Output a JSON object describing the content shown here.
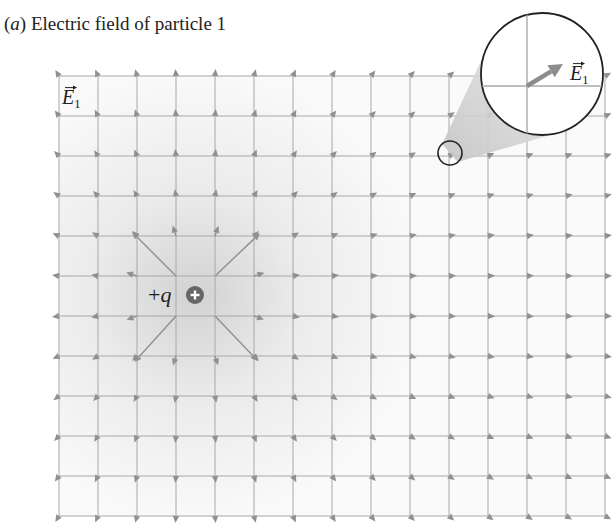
{
  "caption": {
    "label": "a",
    "text": "Electric field of particle 1"
  },
  "field_label": {
    "symbol": "E",
    "subscript": "1",
    "x": 62,
    "y": 104
  },
  "charge": {
    "label_sign": "+",
    "label_var": "q",
    "sign_glyph": "+",
    "x": 195,
    "y": 295,
    "r": 9,
    "color": "#666666"
  },
  "grid": {
    "x0": 59,
    "dx": 39,
    "nx": 15,
    "y0": 76,
    "dy": 40,
    "ny": 12,
    "line_color": "#a8a8a8",
    "arrow_color": "#909090"
  },
  "magnifier": {
    "small": {
      "x": 450,
      "y": 153,
      "r": 12
    },
    "large": {
      "x": 542,
      "y": 74,
      "r": 61
    },
    "crosshair": {
      "x": 527,
      "y": 86
    },
    "arrow_end": {
      "x": 563,
      "y": 64
    },
    "label": {
      "symbol": "E",
      "subscript": "1",
      "x": 570,
      "y": 80
    }
  },
  "colors": {
    "outline": "#222222",
    "shade": "#d9d9d9",
    "cone": "#cfcfcf"
  }
}
